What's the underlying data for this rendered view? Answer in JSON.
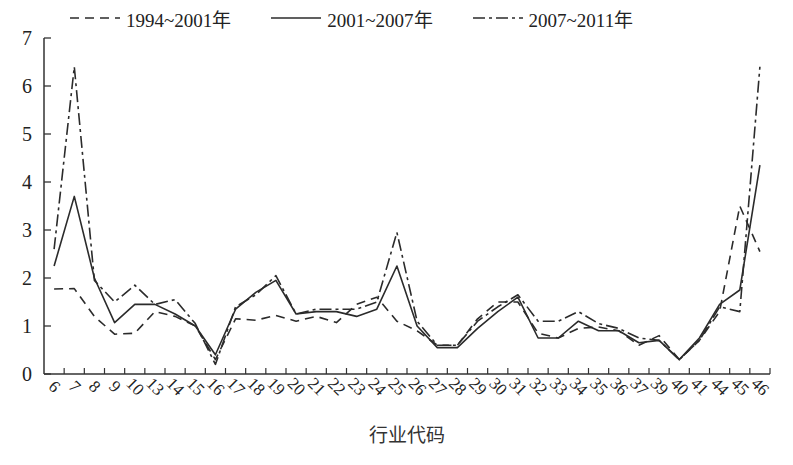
{
  "chart_data": {
    "type": "line",
    "title": "",
    "xlabel": "行业代码",
    "ylabel": "",
    "ylim": [
      0,
      7
    ],
    "yticks": [
      0,
      1,
      2,
      3,
      4,
      5,
      6,
      7
    ],
    "grid": false,
    "legend_position": "top",
    "categories": [
      "6",
      "7",
      "8",
      "9",
      "10",
      "13",
      "14",
      "15",
      "16",
      "17",
      "18",
      "19",
      "20",
      "21",
      "22",
      "23",
      "24",
      "25",
      "26",
      "27",
      "28",
      "29",
      "30",
      "31",
      "32",
      "33",
      "34",
      "35",
      "36",
      "37",
      "39",
      "40",
      "41",
      "44",
      "45",
      "46"
    ],
    "series": [
      {
        "name": "1994~2001年",
        "style": "dashed",
        "values": [
          1.77,
          1.78,
          1.2,
          0.83,
          0.85,
          1.3,
          1.2,
          1.0,
          0.3,
          1.15,
          1.12,
          1.22,
          1.1,
          1.2,
          1.07,
          1.45,
          1.6,
          1.1,
          0.9,
          0.6,
          0.6,
          1.15,
          1.5,
          1.5,
          0.85,
          0.75,
          0.95,
          0.98,
          0.9,
          0.6,
          0.8,
          0.3,
          0.7,
          1.3,
          3.5,
          2.55
        ]
      },
      {
        "name": "2001~2007年",
        "style": "solid",
        "values": [
          2.25,
          3.7,
          2.0,
          1.07,
          1.45,
          1.45,
          1.25,
          1.0,
          0.4,
          1.35,
          1.7,
          1.95,
          1.25,
          1.3,
          1.3,
          1.2,
          1.35,
          2.25,
          1.0,
          0.55,
          0.55,
          0.95,
          1.3,
          1.6,
          0.75,
          0.75,
          1.1,
          0.9,
          0.9,
          0.65,
          0.7,
          0.3,
          0.75,
          1.45,
          1.75,
          4.35
        ]
      },
      {
        "name": "2007~2011年",
        "style": "dashdot",
        "values": [
          2.6,
          6.4,
          1.95,
          1.5,
          1.85,
          1.45,
          1.55,
          1.05,
          0.2,
          1.4,
          1.65,
          2.05,
          1.25,
          1.35,
          1.35,
          1.35,
          1.5,
          2.95,
          1.1,
          0.6,
          0.6,
          1.1,
          1.4,
          1.65,
          1.1,
          1.1,
          1.3,
          1.05,
          0.95,
          0.75,
          0.7,
          0.3,
          0.7,
          1.4,
          1.3,
          6.4
        ]
      }
    ]
  },
  "legend": {
    "items": [
      {
        "label": "1994~2001年",
        "style": "dashed"
      },
      {
        "label": "2001~2007年",
        "style": "solid"
      },
      {
        "label": "2007~2011年",
        "style": "dashdot"
      }
    ]
  },
  "colors": {
    "line": "#2b2b2b",
    "axis": "#333333",
    "text": "#222222"
  }
}
